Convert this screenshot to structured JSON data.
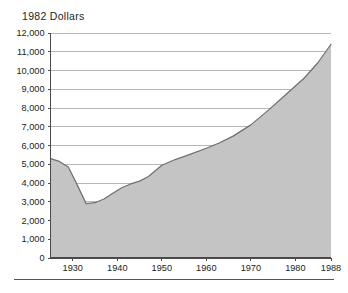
{
  "chart_data": {
    "type": "area",
    "title": "1982 Dollars",
    "xlabel": "",
    "ylabel": "",
    "xlim": [
      1925,
      1988
    ],
    "ylim": [
      0,
      12000
    ],
    "grid": true,
    "legend": "none",
    "fill_color": "#c4c4c4",
    "line_color": "#6f6f6f",
    "y_ticks": [
      "12,000",
      "11,000",
      "10,000",
      "9,000",
      "8,000",
      "7,000",
      "6,000",
      "5,000",
      "4,000",
      "3,000",
      "2,000",
      "1,000",
      "0"
    ],
    "y_tick_values": [
      12000,
      11000,
      10000,
      9000,
      8000,
      7000,
      6000,
      5000,
      4000,
      3000,
      2000,
      1000,
      0
    ],
    "x_ticks": [
      "1930",
      "1940",
      "1950",
      "1960",
      "1970",
      "1980",
      "1988"
    ],
    "x_tick_values": [
      1930,
      1940,
      1950,
      1960,
      1970,
      1980,
      1988
    ],
    "x": [
      1925,
      1927,
      1929,
      1931,
      1933,
      1935,
      1937,
      1939,
      1941,
      1943,
      1945,
      1947,
      1950,
      1953,
      1956,
      1960,
      1963,
      1966,
      1970,
      1974,
      1978,
      1982,
      1985,
      1988
    ],
    "values": [
      5300,
      5150,
      4850,
      3900,
      2900,
      2950,
      3150,
      3450,
      3750,
      3950,
      4100,
      4350,
      4950,
      5250,
      5500,
      5850,
      6150,
      6500,
      7100,
      7900,
      8750,
      9600,
      10400,
      11400
    ]
  },
  "footer": {
    "note": ""
  }
}
